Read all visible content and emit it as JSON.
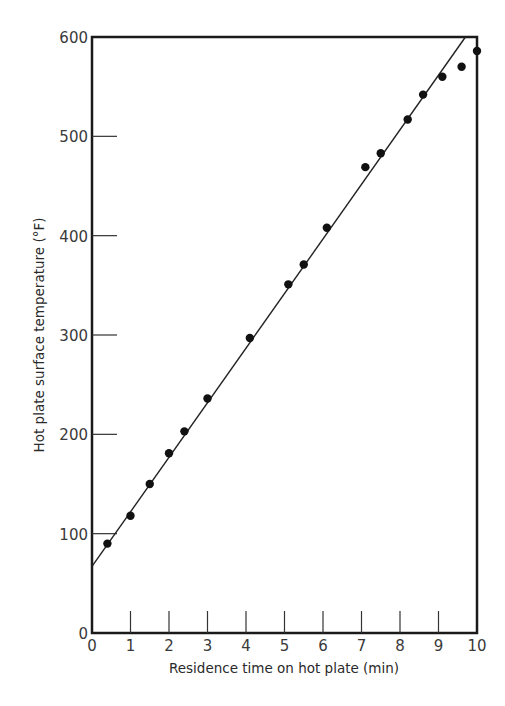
{
  "chart_data": {
    "type": "scatter",
    "title": "",
    "xlabel": "Residence time on hot plate (min)",
    "ylabel": "Hot plate surface temperature (°F)",
    "xlim": [
      0,
      10
    ],
    "ylim": [
      0,
      600
    ],
    "x_ticks": [
      0,
      1,
      2,
      3,
      4,
      5,
      6,
      7,
      8,
      9,
      10
    ],
    "x_tick_labels": [
      "0",
      "1",
      "2",
      "3",
      "4",
      "5",
      "6",
      "7",
      "8",
      "9",
      "10"
    ],
    "y_ticks": [
      0,
      100,
      200,
      300,
      400,
      500,
      600
    ],
    "y_tick_labels": [
      "0",
      "100",
      "200",
      "300",
      "400",
      "500",
      "600"
    ],
    "grid": false,
    "legend": null,
    "series": [
      {
        "name": "Measured",
        "kind": "scatter",
        "marker": "filled-circle",
        "color": "#111111",
        "points": [
          {
            "x": 0.4,
            "y": 90
          },
          {
            "x": 1.0,
            "y": 118
          },
          {
            "x": 1.5,
            "y": 150
          },
          {
            "x": 2.0,
            "y": 181
          },
          {
            "x": 2.4,
            "y": 203
          },
          {
            "x": 3.0,
            "y": 236
          },
          {
            "x": 4.1,
            "y": 297
          },
          {
            "x": 5.1,
            "y": 351
          },
          {
            "x": 5.5,
            "y": 371
          },
          {
            "x": 6.1,
            "y": 408
          },
          {
            "x": 7.1,
            "y": 469
          },
          {
            "x": 7.5,
            "y": 483
          },
          {
            "x": 8.2,
            "y": 517
          },
          {
            "x": 8.6,
            "y": 542
          },
          {
            "x": 9.1,
            "y": 560
          },
          {
            "x": 9.6,
            "y": 570
          },
          {
            "x": 10.0,
            "y": 586
          }
        ]
      },
      {
        "name": "Linear fit",
        "kind": "line",
        "color": "#222222",
        "points": [
          {
            "x": 0,
            "y": 67
          },
          {
            "x": 9.7,
            "y": 600
          }
        ]
      }
    ]
  }
}
